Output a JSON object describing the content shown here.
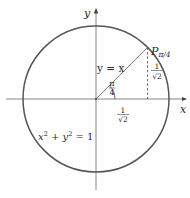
{
  "diagram": {
    "axes": {
      "x_label": "x",
      "y_label": "y"
    },
    "circle": {
      "equation_lhs_x": "x",
      "equation_sup_x": "2",
      "equation_plus": " + ",
      "equation_lhs_y": "y",
      "equation_sup_y": "2",
      "equation_rhs": " = 1"
    },
    "line_label": "y = x",
    "point": {
      "name": "P",
      "subscript": "π/4"
    },
    "angle": {
      "numerator": "π",
      "denominator": "4"
    },
    "x_coord": {
      "numerator": "1",
      "denominator": "√2"
    },
    "y_coord": {
      "numerator": "1",
      "denominator": "√2"
    },
    "colors": {
      "stroke": "#555555",
      "text": "#2a2a2a",
      "background": "#ffffff"
    }
  }
}
